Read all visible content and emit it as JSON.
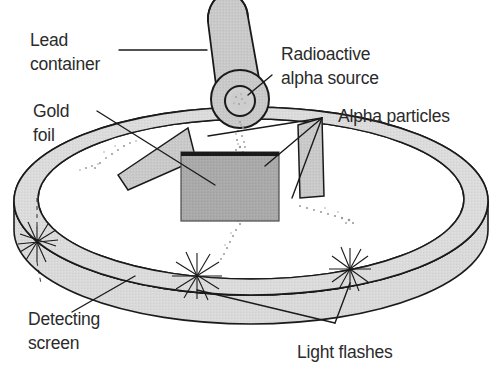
{
  "figure": {
    "background_color": "#ffffff",
    "ink_color": "#1a1a1a",
    "text_color": "#2b2b2b"
  },
  "labels": {
    "lead_container": {
      "line1": "Lead",
      "line2": "container"
    },
    "radioactive_source": {
      "line1": "Radioactive",
      "line2": "alpha source"
    },
    "gold_foil": {
      "line1": "Gold",
      "line2": "foil"
    },
    "alpha_particles": {
      "line1": "Alpha particles"
    },
    "detecting_screen": {
      "line1": "Detecting",
      "line2": "screen"
    },
    "light_flashes": {
      "line1": "Light flashes"
    }
  },
  "parts": {
    "lead_container": {
      "name": "Lead container",
      "shape": "tilted cylinder",
      "body_color": "#c9c9c9",
      "edge_color": "#1a1a1a"
    },
    "alpha_source": {
      "name": "Radioactive alpha source",
      "shape": "inner circle in cylinder face",
      "fill_color": "#d0d0d0"
    },
    "gold_foil": {
      "name": "Gold foil",
      "shape": "rectangle",
      "fill_color": "#a9a9a9",
      "top_edge_color": "#1a1a1a"
    },
    "detecting_screen": {
      "name": "Detecting screen",
      "shape": "circular band ring in perspective",
      "fill_color": "#d9d9d9",
      "edge_color": "#1a1a1a"
    },
    "light_flashes": {
      "name": "Light flashes",
      "shape": "starburst",
      "count": 3,
      "color": "#1a1a1a"
    },
    "alpha_particle_trails": {
      "name": "Alpha particle trails",
      "style": "dotted speckled streams",
      "count": 4,
      "color": "#9a9a9a"
    }
  }
}
